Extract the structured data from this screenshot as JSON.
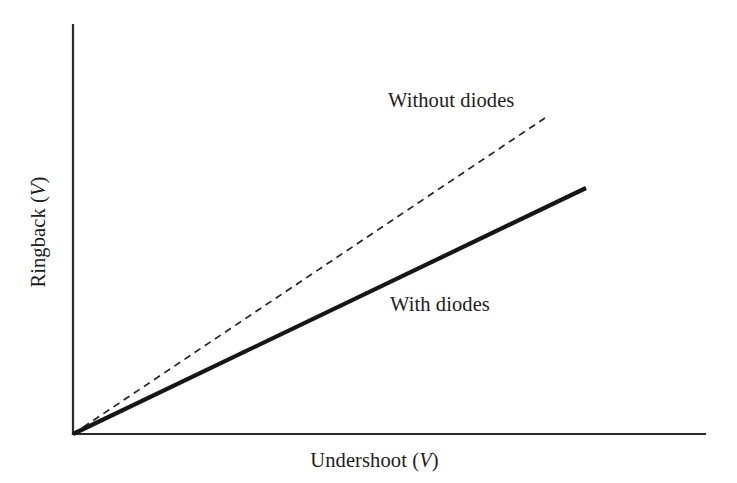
{
  "figure": {
    "background_color": "#ffffff",
    "ink_color": "#1a1a1a"
  },
  "axes": {
    "x_title_text": "Undershoot (",
    "x_title_unit": "V",
    "x_title_close": ")",
    "y_title_text": "Ringback (",
    "y_title_unit": "V",
    "y_title_close": ")",
    "origin_x": 73,
    "origin_y": 434,
    "x_axis_end_x": 705,
    "y_axis_top_y": 25,
    "axis_color": "#2b2b2b",
    "tick_labels_x": [],
    "tick_labels_y": [],
    "grid": "off"
  },
  "series": {
    "without_diodes": {
      "label": "Without diodes",
      "style": "dashed",
      "color": "#242424",
      "label_x": 388,
      "label_y": 90
    },
    "with_diodes": {
      "label": "With diodes",
      "style": "solid",
      "color": "#161616",
      "label_x": 390,
      "label_y": 294
    }
  },
  "chart_data": {
    "type": "line",
    "title": "",
    "subtitle": "",
    "xlabel": "Undershoot (V)",
    "ylabel": "Ringback (V)",
    "xlim": [
      0,
      1
    ],
    "ylim": [
      0,
      1
    ],
    "grid": false,
    "legend": "inline-annotations",
    "axis_ticks": "none",
    "note": "Schematic/conceptual plot: unlabeled axes, two straight proportional lines through the origin.",
    "series": [
      {
        "name": "Without diodes",
        "style": "dashed",
        "color": "#242424",
        "slope": 0.772,
        "x": [
          0.0,
          0.25,
          0.5,
          0.75
        ],
        "y": [
          0.0,
          0.193,
          0.386,
          0.579
        ],
        "pixel_start": [
          73,
          434
        ],
        "pixel_end": [
          545,
          118
        ],
        "annotation": "Without diodes"
      },
      {
        "name": "With diodes",
        "style": "solid",
        "color": "#161616",
        "slope": 0.48,
        "x": [
          0.0,
          0.27,
          0.54,
          0.81
        ],
        "y": [
          0.0,
          0.13,
          0.26,
          0.389
        ],
        "pixel_start": [
          73,
          434
        ],
        "pixel_end": [
          586,
          188
        ],
        "annotation": "With diodes"
      }
    ],
    "legend_entries": [
      "Without diodes",
      "With diodes"
    ],
    "annotations": [
      {
        "text": "Without diodes",
        "x": 388,
        "y": 90
      },
      {
        "text": "With diodes",
        "x": 390,
        "y": 294
      }
    ]
  }
}
